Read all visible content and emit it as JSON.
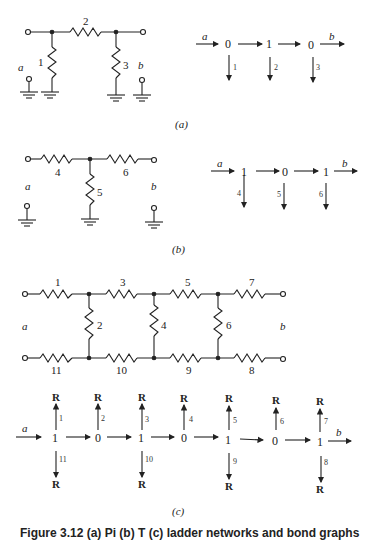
{
  "figure": {
    "caption": "Figure 3.12 (a) Pi (b) T (c) ladder networks and bond graphs",
    "parts": [
      {
        "label": "(a)",
        "circuit": {
          "ports": [
            "a",
            "b"
          ],
          "resistors": [
            "1",
            "2",
            "3"
          ]
        },
        "bond_graph": {
          "input": "a",
          "output": "b",
          "junctions": [
            "0",
            "1",
            "0"
          ],
          "bonds": [
            "1",
            "2",
            "3"
          ]
        }
      },
      {
        "label": "(b)",
        "circuit": {
          "ports": [
            "a",
            "b"
          ],
          "resistors": [
            "4",
            "5",
            "6"
          ]
        },
        "bond_graph": {
          "input": "a",
          "output": "b",
          "junctions": [
            "1",
            "0",
            "1"
          ],
          "bonds": [
            "4",
            "5",
            "6"
          ]
        }
      },
      {
        "label": "(c)",
        "circuit": {
          "ports": [
            "a",
            "b"
          ],
          "top_resistors": [
            "1",
            "3",
            "5",
            "7"
          ],
          "shunt_resistors": [
            "2",
            "4",
            "6"
          ],
          "bottom_resistors": [
            "11",
            "10",
            "9",
            "8"
          ]
        },
        "bond_graph": {
          "input": "a",
          "output": "b",
          "junctions": [
            "1",
            "0",
            "1",
            "0",
            "1",
            "0",
            "1"
          ],
          "up_bonds": [
            "1",
            "2",
            "3",
            "4",
            "5",
            "6",
            "7"
          ],
          "down_bonds": [
            "11",
            "10",
            "9",
            "8"
          ],
          "element": "R"
        }
      }
    ]
  }
}
